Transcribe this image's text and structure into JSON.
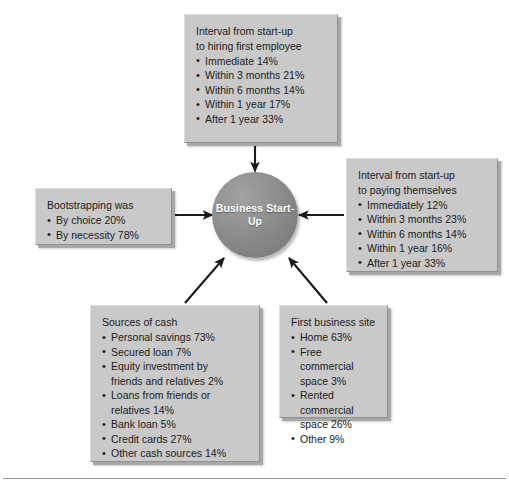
{
  "diagram": {
    "kind": "hub-and-spoke-diagram",
    "center": {
      "label": "Business\nStart-Up",
      "fill_color": "#8d8d8d",
      "text_color": "#ffffff"
    },
    "box_fill_color": "#c9c9c9",
    "box_text_color": "#1b1b1b",
    "arrow_color": "#1a1a1a",
    "arrow_direction": "toward-center",
    "boxes": [
      {
        "id": "hiring-first-employee",
        "title": "Interval from start-up\nto hiring first employee",
        "items": [
          "Immediate  14%",
          "Within 3 months  21%",
          "Within 6 months  14%",
          "Within 1 year  17%",
          "After 1 year  33%"
        ]
      },
      {
        "id": "paying-themselves",
        "title": "Interval from start-up\nto paying themselves",
        "items": [
          "Immediately  12%",
          "Within 3 months  23%",
          "Within 6 months  14%",
          "Within 1 year  16%",
          "After 1 year  33%"
        ]
      },
      {
        "id": "bootstrapping",
        "title": "Bootstrapping was",
        "items": [
          "By choice  20%",
          "By necessity  78%"
        ]
      },
      {
        "id": "sources-of-cash",
        "title": "Sources of cash",
        "items": [
          "Personal savings  73%",
          "Secured loan  7%",
          "Equity investment by\nfriends and relatives  2%",
          "Loans from friends or\nrelatives  14%",
          "Bank loan  5%",
          "Credit cards  27%",
          "Other cash sources  14%"
        ]
      },
      {
        "id": "first-business-site",
        "title": "First business site",
        "items": [
          "Home  63%",
          "Free commercial\nspace  3%",
          "Rented commercial\nspace  26%",
          "Other  9%"
        ]
      }
    ]
  }
}
